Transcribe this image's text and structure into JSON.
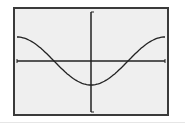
{
  "graph": {
    "function_label": "y = -cos(x)",
    "colors": {
      "screen_background": "#efefef",
      "frame": "#3a3a3a",
      "axis": "#222222",
      "curve": "#222222"
    },
    "window": {
      "xmin": -3.14159,
      "xmax": 3.14159,
      "ymin": -2,
      "ymax": 2
    }
  },
  "chart_data": {
    "type": "line",
    "title": "",
    "xlabel": "",
    "ylabel": "",
    "grid": false,
    "xlim": [
      -3.14159,
      3.14159
    ],
    "ylim": [
      -2,
      2
    ],
    "series": [
      {
        "name": "y = -cos(x)",
        "x": [
          -3.14159,
          -2.35619,
          -1.5708,
          -0.7854,
          0,
          0.7854,
          1.5708,
          2.35619,
          3.14159
        ],
        "y": [
          1,
          0.707,
          0,
          -0.707,
          -1,
          -0.707,
          0,
          0.707,
          1
        ]
      }
    ]
  }
}
